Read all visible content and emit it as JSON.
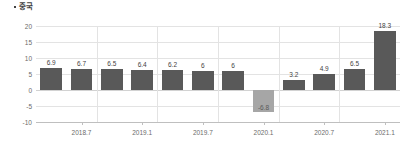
{
  "chart_data": {
    "type": "bar",
    "title": "중국",
    "title_bullet": "•",
    "xlabel": "",
    "ylabel": "",
    "ylim": [
      -10,
      20
    ],
    "yticks": [
      20,
      15,
      10,
      5,
      0,
      -5,
      -10
    ],
    "ytick_labels": [
      "20",
      "15",
      "10",
      "5",
      "0",
      "-5",
      "-10"
    ],
    "grid": true,
    "legend": false,
    "categories": [
      "2018.4",
      "2018.7",
      "2018.10",
      "2019.1",
      "2019.4",
      "2019.7",
      "2019.10",
      "2020.1",
      "2020.4",
      "2020.7",
      "2020.10",
      "2021.1"
    ],
    "values": [
      6.9,
      6.7,
      6.5,
      6.4,
      6.2,
      6,
      6,
      -6.8,
      3.2,
      4.9,
      6.5,
      18.3
    ],
    "value_labels": [
      "6.9",
      "6.7",
      "6.5",
      "6.4",
      "6.2",
      "6",
      "6",
      "-6.8",
      "3.2",
      "4.9",
      "6.5",
      "18.3"
    ],
    "xtick_labels": [
      "2018.7",
      "2019.1",
      "2019.7",
      "2020.1",
      "2020.7",
      "2021.1"
    ],
    "xtick_positions": [
      1,
      3,
      5,
      7,
      9,
      11
    ],
    "colors": {
      "bar_positive": "#595959",
      "bar_negative": "#a6a6a6",
      "gridline": "#e3e3e3",
      "axis": "#bfbfbf",
      "text": "#6b6b6b",
      "label_text": "#3f3f3f"
    }
  }
}
